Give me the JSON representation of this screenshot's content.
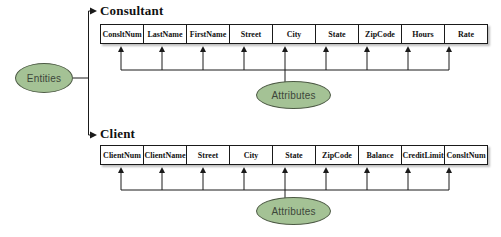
{
  "diagram": {
    "entities_label": "Entities",
    "attributes_label": "Attributes",
    "line_color": "#1a1a1a",
    "ellipse_fill": "#a4c295",
    "ellipse_border": "#4d5a45",
    "entities": [
      {
        "name": "Consultant",
        "columns": [
          "ConsltNum",
          "LastName",
          "FirstName",
          "Street",
          "City",
          "State",
          "ZipCode",
          "Hours",
          "Rate"
        ]
      },
      {
        "name": "Client",
        "columns": [
          "ClientNum",
          "ClientName",
          "Street",
          "City",
          "State",
          "ZipCode",
          "Balance",
          "CreditLimit",
          "ConsltNum"
        ]
      }
    ]
  }
}
